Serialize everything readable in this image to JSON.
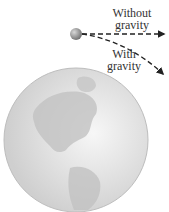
{
  "labels": {
    "without_line1": "Without",
    "without_line2": "gravity",
    "with_line1": "With",
    "with_line2": "gravity"
  },
  "colors": {
    "earth_fill": "#d9d9d9",
    "land": "#c4c4c4",
    "ball": "#8a8a8a",
    "path": "#222222"
  }
}
